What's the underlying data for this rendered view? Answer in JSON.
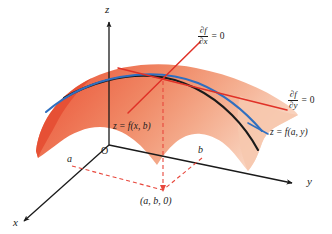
{
  "figure": {
    "background_color": "#ffffff",
    "axes": {
      "z_label": "z",
      "x_label": "x",
      "y_label": "y",
      "origin_label": "O",
      "axis_color": "#1a1a1a"
    },
    "point_markers": {
      "a_label": "a",
      "b_label": "b",
      "base_point_label": "(a, b, 0)"
    },
    "surface": {
      "fill_color_dark": "#ec6144",
      "fill_color_light": "#f7c3ac",
      "description": "orange dome-shaped surface z = f(x, y)"
    },
    "curves": [
      {
        "name": "trace-x",
        "label": "z = f(x, b)",
        "color": "#1a1a1a"
      },
      {
        "name": "trace-y",
        "label": "z = f(a, y)",
        "color": "#2f6fc0"
      }
    ],
    "tangents": [
      {
        "name": "tangent-x",
        "color": "#e03127",
        "numerator": "∂f",
        "denominator": "∂x",
        "equals": "=",
        "value": "0"
      },
      {
        "name": "tangent-y",
        "color": "#e03127",
        "numerator": "∂f",
        "denominator": "∂y",
        "equals": "=",
        "value": "0"
      }
    ],
    "projection_lines": {
      "color": "#e8473c",
      "style": "dashed"
    }
  }
}
